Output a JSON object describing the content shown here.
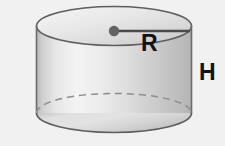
{
  "figure": {
    "background_color": "#f1f1f1",
    "shape": "cylinder",
    "labels": {
      "radius": "R",
      "height": "H"
    },
    "colors": {
      "outline": "#5e5e5e",
      "top_face_light": "#f0f0f0",
      "top_face_mid": "#dcdcdc",
      "top_face_dark": "#c9c9c9",
      "body_light": "#f4f4f4",
      "body_mid": "#d8d8d8",
      "body_dark": "#bdbdbd",
      "center_dot": "#636363",
      "radius_line": "#4a4a4a",
      "hidden_edge": "#8a8a8a",
      "label_text": "#131313"
    },
    "geometry": {
      "canvas_width": 225,
      "canvas_height": 146,
      "left_edge_x": 36,
      "right_edge_x": 191,
      "top_ellipse_center_y": 26,
      "bottom_ellipse_center_y": 113,
      "ellipse_rx": 77.5,
      "ellipse_ry": 19.5,
      "center_dot_x": 114,
      "center_dot_y": 31,
      "center_dot_radius": 5,
      "radius_line_end_x": 190
    },
    "label_positions": {
      "radius_x": 141,
      "radius_y": 51,
      "height_x": 199,
      "height_y": 80
    },
    "annotations": {
      "radius_description": "radius measured from center of top face to rim",
      "height_description": "height measured along the right side of the cylinder",
      "hidden_edge_description": "dashed arc showing the hidden back rim of the base"
    }
  }
}
